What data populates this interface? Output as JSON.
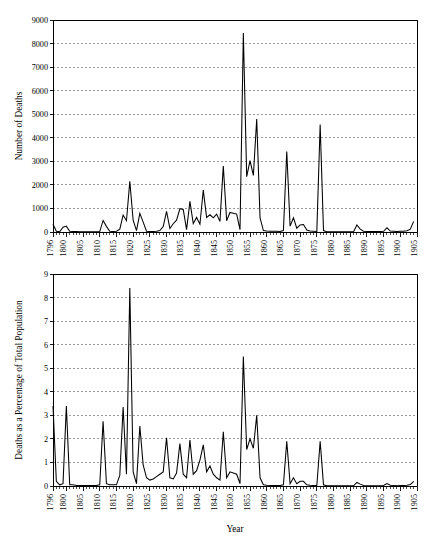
{
  "chart_data": [
    {
      "type": "line",
      "title": "",
      "xlabel": "",
      "ylabel": "Number of Deaths",
      "xlim": [
        1796,
        1905
      ],
      "ylim": [
        0,
        9000
      ],
      "ytick_step": 1000,
      "yticks": [
        0,
        1000,
        2000,
        3000,
        4000,
        5000,
        6000,
        7000,
        8000,
        9000
      ],
      "xticks": [
        1796,
        1800,
        1805,
        1810,
        1815,
        1820,
        1825,
        1830,
        1835,
        1840,
        1845,
        1850,
        1855,
        1860,
        1865,
        1870,
        1875,
        1880,
        1885,
        1890,
        1895,
        1900,
        1905
      ],
      "grid": "horizontal-dashed",
      "legend": "none",
      "x": [
        1796,
        1797,
        1798,
        1799,
        1800,
        1801,
        1802,
        1803,
        1804,
        1805,
        1806,
        1807,
        1808,
        1809,
        1810,
        1811,
        1812,
        1813,
        1814,
        1815,
        1816,
        1817,
        1818,
        1819,
        1820,
        1821,
        1822,
        1823,
        1824,
        1825,
        1826,
        1827,
        1828,
        1829,
        1830,
        1831,
        1832,
        1833,
        1834,
        1835,
        1836,
        1837,
        1838,
        1839,
        1840,
        1841,
        1842,
        1843,
        1844,
        1845,
        1846,
        1847,
        1848,
        1849,
        1850,
        1851,
        1852,
        1853,
        1854,
        1855,
        1856,
        1857,
        1858,
        1859,
        1860,
        1861,
        1862,
        1863,
        1864,
        1865,
        1866,
        1867,
        1868,
        1869,
        1870,
        1871,
        1872,
        1873,
        1874,
        1875,
        1876,
        1877,
        1878,
        1879,
        1880,
        1881,
        1882,
        1883,
        1884,
        1885,
        1886,
        1887,
        1888,
        1889,
        1890,
        1891,
        1892,
        1893,
        1894,
        1895,
        1896,
        1897,
        1898,
        1899,
        1900,
        1901,
        1902,
        1903,
        1904,
        1905
      ],
      "values": [
        330,
        30,
        10,
        200,
        250,
        30,
        20,
        20,
        10,
        10,
        10,
        10,
        10,
        10,
        20,
        490,
        240,
        30,
        20,
        30,
        120,
        720,
        480,
        2150,
        500,
        60,
        790,
        420,
        30,
        20,
        20,
        30,
        60,
        230,
        880,
        150,
        350,
        500,
        990,
        960,
        100,
        1300,
        360,
        620,
        330,
        1780,
        620,
        730,
        600,
        760,
        450,
        2800,
        480,
        830,
        800,
        760,
        100,
        8450,
        2350,
        3030,
        2400,
        4800,
        600,
        60,
        40,
        30,
        30,
        30,
        20,
        60,
        3420,
        250,
        600,
        160,
        300,
        320,
        80,
        40,
        30,
        20,
        4560,
        60,
        10,
        10,
        10,
        10,
        10,
        10,
        10,
        10,
        10,
        300,
        120,
        30,
        20,
        20,
        20,
        20,
        20,
        30,
        180,
        40,
        30,
        20,
        30,
        30,
        50,
        120,
        450
      ],
      "annotations": []
    },
    {
      "type": "line",
      "title": "",
      "xlabel": "Year",
      "ylabel": "Deaths as a Percentage of Total Population",
      "xlim": [
        1796,
        1905
      ],
      "ylim": [
        0,
        9
      ],
      "ytick_step": 1,
      "yticks": [
        0,
        1,
        2,
        3,
        4,
        5,
        6,
        7,
        8,
        9
      ],
      "xticks": [
        1796,
        1800,
        1805,
        1810,
        1815,
        1820,
        1825,
        1830,
        1835,
        1840,
        1845,
        1850,
        1855,
        1860,
        1865,
        1870,
        1875,
        1880,
        1885,
        1890,
        1895,
        1900,
        1905
      ],
      "grid": "horizontal-dashed",
      "legend": "none",
      "x": [
        1796,
        1797,
        1798,
        1799,
        1800,
        1801,
        1802,
        1803,
        1804,
        1805,
        1806,
        1807,
        1808,
        1809,
        1810,
        1811,
        1812,
        1813,
        1814,
        1815,
        1816,
        1817,
        1818,
        1819,
        1820,
        1821,
        1822,
        1823,
        1824,
        1825,
        1826,
        1827,
        1828,
        1829,
        1830,
        1831,
        1832,
        1833,
        1834,
        1835,
        1836,
        1837,
        1838,
        1839,
        1840,
        1841,
        1842,
        1843,
        1844,
        1845,
        1846,
        1847,
        1848,
        1849,
        1850,
        1851,
        1852,
        1853,
        1854,
        1855,
        1856,
        1857,
        1858,
        1859,
        1860,
        1861,
        1862,
        1863,
        1864,
        1865,
        1866,
        1867,
        1868,
        1869,
        1870,
        1871,
        1872,
        1873,
        1874,
        1875,
        1876,
        1877,
        1878,
        1879,
        1880,
        1881,
        1882,
        1883,
        1884,
        1885,
        1886,
        1887,
        1888,
        1889,
        1890,
        1891,
        1892,
        1893,
        1894,
        1895,
        1896,
        1897,
        1898,
        1899,
        1900,
        1901,
        1902,
        1903,
        1904,
        1905
      ],
      "values": [
        3.4,
        0.2,
        0.05,
        0.1,
        3.4,
        0.05,
        0.05,
        0.02,
        0.02,
        0.02,
        0.02,
        0.02,
        0.02,
        0.02,
        0.05,
        2.75,
        0.1,
        0.05,
        0.05,
        0.05,
        0.45,
        3.35,
        0.5,
        8.4,
        0.6,
        0.1,
        2.55,
        0.9,
        0.35,
        0.25,
        0.3,
        0.4,
        0.5,
        0.6,
        2.05,
        0.35,
        0.3,
        0.55,
        1.8,
        0.5,
        0.35,
        1.95,
        0.5,
        0.65,
        1.1,
        1.75,
        0.6,
        0.85,
        0.5,
        0.35,
        0.25,
        2.3,
        0.35,
        0.6,
        0.55,
        0.5,
        0.1,
        5.5,
        1.55,
        2.0,
        1.6,
        3.0,
        0.35,
        0.05,
        0.03,
        0.02,
        0.02,
        0.02,
        0.02,
        0.05,
        1.9,
        0.1,
        0.35,
        0.1,
        0.2,
        0.2,
        0.05,
        0.03,
        0.02,
        0.02,
        1.9,
        0.05,
        0.01,
        0.01,
        0.01,
        0.01,
        0.01,
        0.01,
        0.01,
        0.01,
        0.01,
        0.15,
        0.08,
        0.02,
        0.01,
        0.01,
        0.01,
        0.01,
        0.01,
        0.02,
        0.1,
        0.03,
        0.02,
        0.01,
        0.02,
        0.02,
        0.03,
        0.06,
        0.2
      ],
      "annotations": []
    }
  ],
  "figures": {
    "top": {
      "ylabel": "Number of Deaths",
      "ytick_labels": [
        "0",
        "1000",
        "2000",
        "3000",
        "4000",
        "5000",
        "6000",
        "7000",
        "8000",
        "9000"
      ],
      "xtick_labels": [
        "1796",
        "1800",
        "1805",
        "1810",
        "1815",
        "1820",
        "1825",
        "1830",
        "1835",
        "1840",
        "1845",
        "1850",
        "1855",
        "1860",
        "1865",
        "1870",
        "1875",
        "1880",
        "1885",
        "1890",
        "1895",
        "1900",
        "1905"
      ]
    },
    "bottom": {
      "ylabel": "Deaths as a Percentage of Total Population",
      "xlabel": "Year",
      "ytick_labels": [
        "0",
        "1",
        "2",
        "3",
        "4",
        "5",
        "6",
        "7",
        "8",
        "9"
      ],
      "xtick_labels": [
        "1796",
        "1800",
        "1805",
        "1810",
        "1815",
        "1820",
        "1825",
        "1830",
        "1835",
        "1840",
        "1845",
        "1850",
        "1855",
        "1860",
        "1865",
        "1870",
        "1875",
        "1880",
        "1885",
        "1890",
        "1895",
        "1900",
        "1905"
      ]
    }
  },
  "colors": {
    "line": "#000000",
    "grid": "#555555",
    "axis": "#000000",
    "background": "#ffffff"
  }
}
